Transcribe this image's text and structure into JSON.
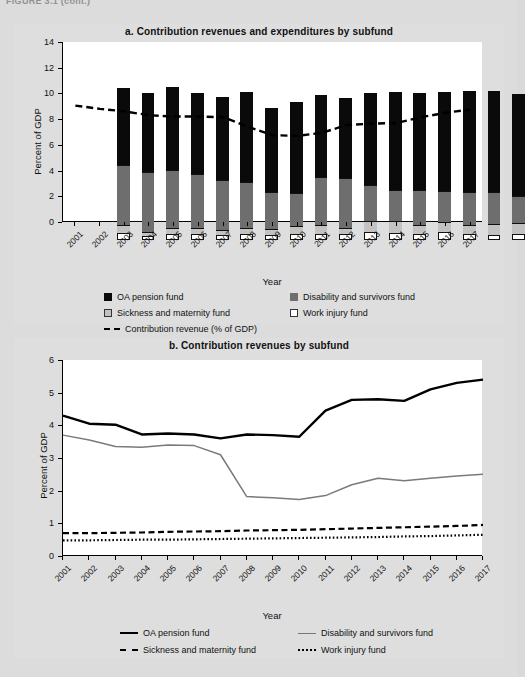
{
  "figure": {
    "top_caption": "FIGURE 3.1 (cont.)"
  },
  "panel_a": {
    "title": "a. Contribution revenues and  expenditures by subfund",
    "ylabel": "Percent of GDP",
    "xlabel": "Year",
    "legend": [
      {
        "key": "oa",
        "label": "OA pension fund"
      },
      {
        "key": "dis",
        "label": "Disability and survivors fund"
      },
      {
        "key": "sick",
        "label": "Sickness and maternity fund"
      },
      {
        "key": "work",
        "label": "Work injury fund"
      },
      {
        "key": "rev",
        "label": "Contribution revenue (% of GDP)"
      }
    ]
  },
  "panel_b": {
    "title": "b. Contribution revenues by subfund",
    "ylabel": "Percent of GDP",
    "xlabel": "Year",
    "legend": [
      {
        "key": "oa",
        "label": "OA pension fund"
      },
      {
        "key": "dis",
        "label": "Disability and survivors fund"
      },
      {
        "key": "sick",
        "label": "Sickness and maternity fund"
      },
      {
        "key": "work",
        "label": "Work injury fund"
      }
    ]
  },
  "chart_data": [
    {
      "id": "panel_a",
      "type": "bar",
      "stacked": true,
      "title": "a. Contribution revenues and  expenditures by subfund",
      "xlabel": "Year",
      "ylabel": "Percent of GDP",
      "ylim": [
        0,
        14
      ],
      "yticks": [
        0,
        2,
        4,
        6,
        8,
        10,
        12,
        14
      ],
      "grid": false,
      "legend_position": "below",
      "categories": [
        "2001",
        "2002",
        "2003",
        "2004",
        "2005",
        "2006",
        "2007",
        "2008",
        "2009",
        "2010",
        "2011",
        "2012",
        "2013",
        "2014",
        "2015",
        "2016",
        "2017"
      ],
      "series": [
        {
          "name": "OA pension fund",
          "color": "#0a0a0a",
          "values": [
            6.0,
            6.2,
            6.45,
            6.35,
            6.45,
            7.0,
            6.6,
            7.05,
            6.35,
            6.25,
            7.15,
            7.65,
            7.6,
            7.7,
            7.85,
            7.9,
            7.95
          ]
        },
        {
          "name": "Disability and survivors fund",
          "color": "#6e6e6e",
          "values": [
            4.7,
            4.6,
            4.5,
            4.2,
            3.85,
            3.6,
            2.85,
            2.55,
            3.7,
            3.85,
            2.8,
            2.45,
            2.7,
            2.45,
            2.55,
            2.45,
            2.05
          ]
        },
        {
          "name": "Sickness and maternity fund",
          "color": "#c2c2c2",
          "values": [
            0.6,
            0.35,
            0.45,
            0.45,
            0.45,
            0.45,
            0.45,
            0.65,
            0.7,
            0.5,
            0.9,
            0.9,
            0.7,
            0.8,
            0.75,
            0.85,
            0.9
          ]
        },
        {
          "name": "Work injury fund",
          "color": "#ffffff",
          "values": [
            0.55,
            0.3,
            0.5,
            0.45,
            0.35,
            0.45,
            0.4,
            0.45,
            0.5,
            0.45,
            0.6,
            0.55,
            0.45,
            0.6,
            0.45,
            0.4,
            0.45
          ]
        }
      ],
      "overlay_line": {
        "name": "Contribution revenue (% of GDP)",
        "style": "dashed",
        "color": "#000000",
        "values": [
          9.05,
          8.8,
          8.6,
          8.3,
          8.2,
          8.2,
          8.15,
          7.4,
          6.75,
          6.7,
          6.95,
          7.55,
          7.65,
          7.7,
          8.15,
          8.5,
          8.75
        ]
      }
    },
    {
      "id": "panel_b",
      "type": "line",
      "title": "b. Contribution revenues by subfund",
      "xlabel": "Year",
      "ylabel": "Percent of GDP",
      "ylim": [
        0,
        6
      ],
      "yticks": [
        0,
        1,
        2,
        3,
        4,
        5,
        6
      ],
      "grid": false,
      "legend_position": "below",
      "x": [
        "2001",
        "2002",
        "2003",
        "2004",
        "2005",
        "2006",
        "2007",
        "2008",
        "2009",
        "2010",
        "2011",
        "2012",
        "2013",
        "2014",
        "2015",
        "2016",
        "2017"
      ],
      "series": [
        {
          "name": "OA pension fund",
          "style": "solid",
          "color": "#000000",
          "width": 2.4,
          "values": [
            4.3,
            4.05,
            4.02,
            3.72,
            3.75,
            3.72,
            3.6,
            3.72,
            3.7,
            3.65,
            4.45,
            4.78,
            4.8,
            4.75,
            5.1,
            5.3,
            5.4
          ]
        },
        {
          "name": "Disability and survivors fund",
          "style": "solid",
          "color": "#7a7a7a",
          "width": 1.5,
          "values": [
            3.7,
            3.55,
            3.35,
            3.33,
            3.4,
            3.38,
            3.1,
            1.82,
            1.78,
            1.73,
            1.85,
            2.18,
            2.38,
            2.3,
            2.38,
            2.45,
            2.5
          ]
        },
        {
          "name": "Sickness and maternity fund",
          "style": "dashed",
          "color": "#000000",
          "width": 2.2,
          "values": [
            0.7,
            0.7,
            0.71,
            0.72,
            0.74,
            0.75,
            0.76,
            0.78,
            0.79,
            0.8,
            0.82,
            0.84,
            0.86,
            0.88,
            0.9,
            0.92,
            0.95
          ]
        },
        {
          "name": "Work injury fund",
          "style": "dotted",
          "color": "#000000",
          "width": 2.2,
          "values": [
            0.48,
            0.48,
            0.49,
            0.5,
            0.5,
            0.51,
            0.52,
            0.53,
            0.54,
            0.55,
            0.56,
            0.57,
            0.58,
            0.6,
            0.61,
            0.63,
            0.65
          ]
        }
      ]
    }
  ]
}
